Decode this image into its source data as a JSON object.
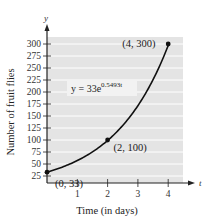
{
  "chart_data": {
    "type": "line",
    "title": "",
    "xlabel": "Time (in days)",
    "ylabel": "Number of fruit flies",
    "x_axis_var": "t",
    "y_axis_var": "y",
    "xlim": [
      0,
      4.5
    ],
    "ylim": [
      25,
      310
    ],
    "x_ticks": [
      1,
      2,
      3,
      4
    ],
    "y_ticks": [
      25,
      50,
      75,
      100,
      125,
      150,
      175,
      200,
      225,
      250,
      275,
      300
    ],
    "grid": true,
    "equation": {
      "base": "y = 33e",
      "exponent": "0.5493t"
    },
    "series": [
      {
        "name": "y = 33e^(0.5493t)",
        "function": "33*exp(0.5493*t)",
        "domain": [
          0,
          4
        ]
      }
    ],
    "points": [
      {
        "x": 0,
        "y": 33,
        "label": "(0, 33)"
      },
      {
        "x": 2,
        "y": 100,
        "label": "(2, 100)"
      },
      {
        "x": 4,
        "y": 300,
        "label": "(4, 300)"
      }
    ],
    "colors": {
      "plot_bg": "#e4e4e4",
      "grid": "#ffffff",
      "curve": "#111111",
      "axis": "#222222"
    }
  }
}
